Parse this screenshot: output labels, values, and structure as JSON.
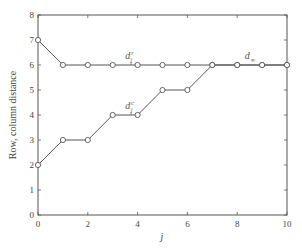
{
  "chart_data": {
    "type": "line",
    "title": "",
    "xlabel": "j",
    "ylabel": "Row, column distance",
    "xlim": [
      0,
      10
    ],
    "ylim": [
      0,
      8
    ],
    "x_ticks": [
      0,
      2,
      4,
      6,
      8,
      10
    ],
    "y_ticks": [
      0,
      1,
      2,
      3,
      4,
      5,
      6,
      7,
      8
    ],
    "grid": false,
    "legend": "none (inline labels)",
    "x": [
      0,
      1,
      2,
      3,
      4,
      5,
      6,
      7,
      8,
      9,
      10
    ],
    "series": [
      {
        "name": "d_j^r",
        "label_main": "d",
        "label_sup": "r",
        "label_sub": "j",
        "values": [
          7,
          6,
          6,
          6,
          6,
          6,
          6,
          6,
          6,
          6,
          6
        ],
        "marker": "circle",
        "label_pos": [
          3.5,
          6.25
        ]
      },
      {
        "name": "d_j^c",
        "label_main": "d",
        "label_sup": "c",
        "label_sub": "j",
        "values": [
          2,
          3,
          3,
          4,
          4,
          5,
          5,
          6,
          6,
          6,
          6
        ],
        "marker": "circle",
        "label_pos": [
          3.5,
          4.25
        ]
      }
    ],
    "annotations": [
      {
        "text": "d_∞",
        "main": "d",
        "sub": "∞",
        "pos": [
          8.3,
          6.25
        ]
      }
    ]
  },
  "colors": {
    "line": "#555555",
    "marker": "#555555",
    "axis": "#555555",
    "background": "#ffffff"
  }
}
